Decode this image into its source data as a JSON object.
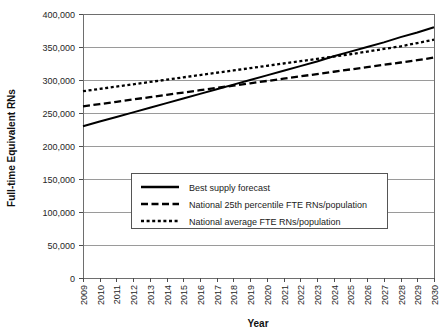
{
  "chart_data": {
    "type": "line",
    "title": "",
    "xlabel": "Year",
    "ylabel": "Full-time Equivalent RNs",
    "ylim": [
      0,
      400000
    ],
    "ytick_labels": [
      "400,000",
      "350,000",
      "300,000",
      "250,000",
      "200,000",
      "150,000",
      "100,000",
      "50,000",
      "0"
    ],
    "ytick_values": [
      400000,
      350000,
      300000,
      250000,
      200000,
      150000,
      100000,
      50000,
      0
    ],
    "grid": true,
    "legend_position": "center",
    "x": [
      2009,
      2010,
      2011,
      2012,
      2013,
      2014,
      2015,
      2016,
      2017,
      2018,
      2019,
      2020,
      2021,
      2022,
      2023,
      2024,
      2025,
      2026,
      2027,
      2028,
      2029,
      2030
    ],
    "categories": [
      "2009",
      "2010",
      "2011",
      "2012",
      "2013",
      "2014",
      "2015",
      "2016",
      "2017",
      "2018",
      "2019",
      "2020",
      "2021",
      "2022",
      "2023",
      "2024",
      "2025",
      "2026",
      "2027",
      "2028",
      "2029",
      "2030"
    ],
    "series": [
      {
        "name": "Best supply forecast",
        "style": "solid",
        "values": [
          230000,
          237000,
          244000,
          251000,
          258000,
          265000,
          272000,
          279000,
          286000,
          293000,
          300000,
          307000,
          314000,
          321000,
          328000,
          336000,
          343000,
          350000,
          357000,
          365000,
          372000,
          380000
        ]
      },
      {
        "name": "National 25th percentile FTE RNs/population",
        "style": "dashed",
        "values": [
          260000,
          263500,
          267000,
          270500,
          274000,
          277500,
          281000,
          284500,
          288000,
          291500,
          295000,
          298500,
          302000,
          305500,
          309000,
          312500,
          316000,
          319500,
          323000,
          326500,
          330000,
          334000
        ]
      },
      {
        "name": "National average FTE RNs/population",
        "style": "dotted",
        "values": [
          283000,
          286500,
          290000,
          293500,
          297000,
          300500,
          304000,
          307500,
          311000,
          314500,
          318000,
          321500,
          325000,
          328500,
          332000,
          335500,
          339000,
          343000,
          347000,
          351000,
          356000,
          361000
        ]
      }
    ],
    "legend_entries": [
      {
        "label": "Best supply forecast",
        "style": "solid"
      },
      {
        "label": "National 25th percentile FTE RNs/population",
        "style": "dashed"
      },
      {
        "label": "National average FTE RNs/population",
        "style": "dotted"
      }
    ]
  }
}
